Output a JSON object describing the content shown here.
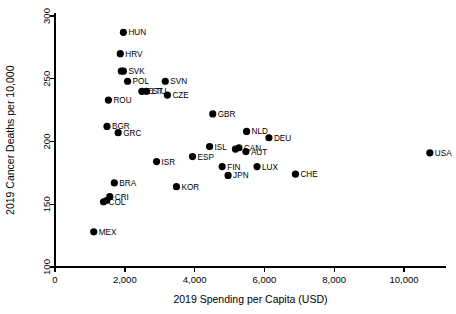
{
  "chart_data": {
    "type": "scatter",
    "title": "",
    "xlabel": "2019 Spending per Capita (USD)",
    "ylabel": "2019 Cancer Deaths per 10,000",
    "xlim": [
      0,
      11200
    ],
    "ylim": [
      100,
      302
    ],
    "xticks": [
      0,
      2000,
      4000,
      6000,
      8000,
      10000
    ],
    "xticklabels": [
      "0",
      "2,000",
      "4,000",
      "6,000",
      "8,000",
      "10,000"
    ],
    "yticks": [
      100,
      150,
      200,
      250,
      300
    ],
    "yticklabels": [
      "100",
      "150",
      "200",
      "250",
      "300"
    ],
    "grid": false,
    "legend": false,
    "marker_color": "#000000",
    "points": [
      {
        "label": "HUN",
        "x": 1960,
        "y": 287
      },
      {
        "label": "HRV",
        "x": 1870,
        "y": 270
      },
      {
        "label": "SVK",
        "x": 1960,
        "y": 256
      },
      {
        "label": "",
        "x": 1900,
        "y": 256
      },
      {
        "label": "POL",
        "x": 2080,
        "y": 248
      },
      {
        "label": "SVN",
        "x": 3160,
        "y": 248
      },
      {
        "label": "EST",
        "x": 2490,
        "y": 240
      },
      {
        "label": "LTU",
        "x": 2620,
        "y": 240
      },
      {
        "label": "CZE",
        "x": 3220,
        "y": 237
      },
      {
        "label": "ROU",
        "x": 1530,
        "y": 233
      },
      {
        "label": "GBR",
        "x": 4520,
        "y": 222
      },
      {
        "label": "BGR",
        "x": 1490,
        "y": 212
      },
      {
        "label": "GRC",
        "x": 1810,
        "y": 207
      },
      {
        "label": "NLD",
        "x": 5490,
        "y": 208
      },
      {
        "label": "DEU",
        "x": 6130,
        "y": 203
      },
      {
        "label": "ISL",
        "x": 4430,
        "y": 196
      },
      {
        "label": "CAN",
        "x": 5270,
        "y": 195
      },
      {
        "label": "",
        "x": 5170,
        "y": 194
      },
      {
        "label": "AUT",
        "x": 5470,
        "y": 192
      },
      {
        "label": "USA",
        "x": 10740,
        "y": 191
      },
      {
        "label": "ESP",
        "x": 3940,
        "y": 188
      },
      {
        "label": "ISR",
        "x": 2910,
        "y": 184
      },
      {
        "label": "LUX",
        "x": 5790,
        "y": 180
      },
      {
        "label": "FIN",
        "x": 4790,
        "y": 180
      },
      {
        "label": "JPN",
        "x": 4960,
        "y": 173
      },
      {
        "label": "CHE",
        "x": 6890,
        "y": 174
      },
      {
        "label": "BRA",
        "x": 1700,
        "y": 167
      },
      {
        "label": "KOR",
        "x": 3480,
        "y": 164
      },
      {
        "label": "CRI",
        "x": 1570,
        "y": 156
      },
      {
        "label": "COL",
        "x": 1390,
        "y": 152
      },
      {
        "label": "",
        "x": 1480,
        "y": 153
      },
      {
        "label": "MEX",
        "x": 1110,
        "y": 128
      }
    ]
  }
}
